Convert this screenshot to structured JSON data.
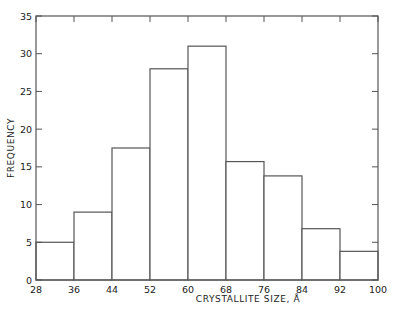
{
  "chart_data": {
    "type": "bar",
    "subtype": "histogram",
    "title": "",
    "xlabel": "CRYSTALLITE SIZE, Å",
    "ylabel": "FREQUENCY",
    "bin_edges": [
      28,
      36,
      44,
      52,
      60,
      68,
      76,
      84,
      92,
      100
    ],
    "categories": [
      "28-36",
      "36-44",
      "44-52",
      "52-60",
      "60-68",
      "68-76",
      "76-84",
      "84-92",
      "92-100"
    ],
    "values": [
      5,
      9,
      17.5,
      28,
      31,
      15.7,
      13.8,
      6.8,
      3.8
    ],
    "xlim": [
      28,
      100
    ],
    "ylim": [
      0,
      35
    ],
    "x_ticks": [
      "28",
      "36",
      "44",
      "52",
      "60",
      "68",
      "76",
      "84",
      "92",
      "100"
    ],
    "y_ticks": [
      "0",
      "5",
      "10",
      "15",
      "20",
      "25",
      "30",
      "35"
    ],
    "grid": false,
    "legend": null,
    "bar_fill": "#ffffff",
    "line_color": "#555555"
  }
}
